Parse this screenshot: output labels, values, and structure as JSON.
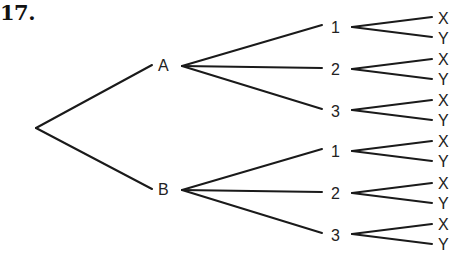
{
  "title": "17.",
  "tree": {
    "root": "",
    "level1": [
      {
        "label": "A",
        "children": [
          {
            "label": "1",
            "children": [
              "X",
              "Y"
            ]
          },
          {
            "label": "2",
            "children": [
              "X",
              "Y"
            ]
          },
          {
            "label": "3",
            "children": [
              "X",
              "Y"
            ]
          }
        ]
      },
      {
        "label": "B",
        "children": [
          {
            "label": "1",
            "children": [
              "X",
              "Y"
            ]
          },
          {
            "label": "2",
            "children": [
              "X",
              "Y"
            ]
          },
          {
            "label": "3",
            "children": [
              "X",
              "Y"
            ]
          }
        ]
      }
    ]
  },
  "colors": {
    "line": "#1a1a1a",
    "text": "#222222",
    "background": "#ffffff"
  }
}
